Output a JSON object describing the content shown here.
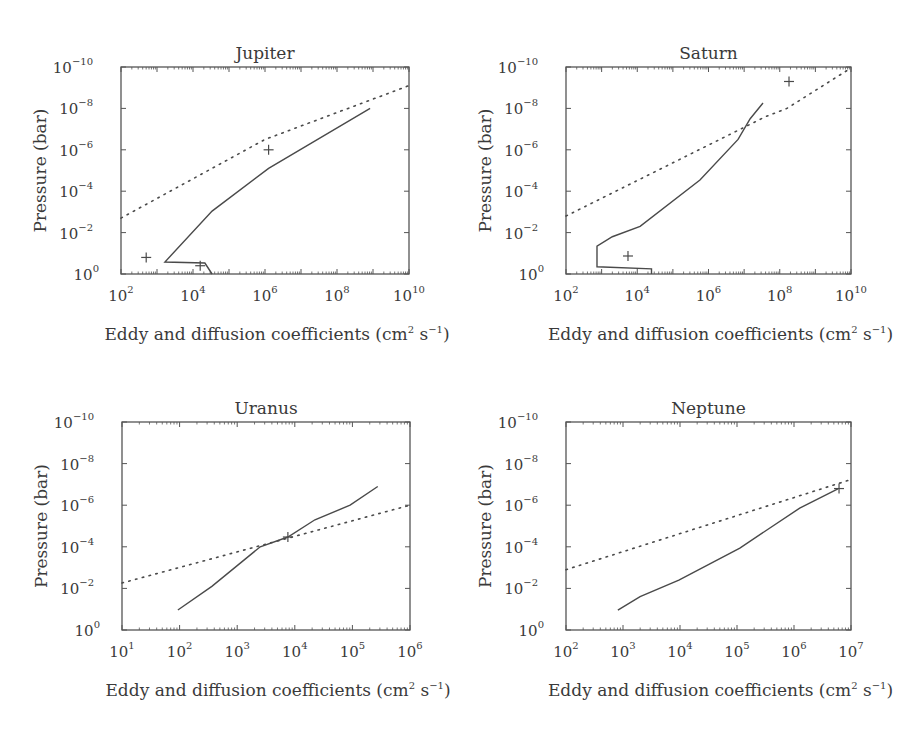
{
  "chart_data": [
    {
      "type": "line",
      "title": "Jupiter",
      "xlabel": "Eddy and diffusion coefficients (cm² s⁻¹)",
      "ylabel": "Pressure (bar)",
      "xscale": "log",
      "yscale": "log",
      "xlim_exp": [
        2,
        10
      ],
      "ylim_exp": [
        0,
        -10
      ],
      "xticks_exp": [
        2,
        4,
        6,
        8,
        10
      ],
      "yticks_exp": [
        -10,
        -8,
        -6,
        -4,
        -2,
        0
      ],
      "box": {
        "x0": 121,
        "x1": 409,
        "y0": 67,
        "y1": 274
      },
      "series": [
        {
          "name": "eddy (solid)",
          "style": "solid",
          "points_log": [
            [
              4.53,
              0.0
            ],
            [
              4.33,
              -0.53
            ],
            [
              3.22,
              -0.58
            ],
            [
              4.53,
              -3.04
            ],
            [
              6.1,
              -5.1
            ],
            [
              8.92,
              -8.0
            ]
          ]
        },
        {
          "name": "diffusion (dotted)",
          "style": "dotted",
          "points_log": [
            [
              2.0,
              -2.7
            ],
            [
              6.0,
              -6.5
            ],
            [
              10.0,
              -9.1
            ]
          ]
        },
        {
          "name": "estimates (+)",
          "style": "marker",
          "points_log": [
            [
              2.7,
              -0.8
            ],
            [
              4.2,
              -0.4
            ],
            [
              6.1,
              -6.0
            ]
          ]
        }
      ]
    },
    {
      "type": "line",
      "title": "Saturn",
      "xlabel": "Eddy and diffusion coefficients (cm² s⁻¹)",
      "ylabel": "Pressure (bar)",
      "xscale": "log",
      "yscale": "log",
      "xlim_exp": [
        2,
        10
      ],
      "ylim_exp": [
        0,
        -10
      ],
      "xticks_exp": [
        2,
        4,
        6,
        8,
        10
      ],
      "yticks_exp": [
        -10,
        -8,
        -6,
        -4,
        -2,
        0
      ],
      "box": {
        "x0": 566,
        "x1": 851,
        "y0": 67,
        "y1": 274
      },
      "series": [
        {
          "name": "eddy (solid)",
          "style": "solid",
          "points_log": [
            [
              4.4,
              0.0
            ],
            [
              4.4,
              -0.25
            ],
            [
              2.87,
              -0.35
            ],
            [
              2.87,
              -1.35
            ],
            [
              3.3,
              -1.8
            ],
            [
              4.08,
              -2.3
            ],
            [
              5.76,
              -4.54
            ],
            [
              6.83,
              -6.5
            ],
            [
              7.17,
              -7.5
            ],
            [
              7.53,
              -8.26
            ]
          ]
        },
        {
          "name": "diffusion (dotted)",
          "style": "dotted",
          "points_log": [
            [
              2.0,
              -2.8
            ],
            [
              7.6,
              -7.6
            ],
            [
              8.2,
              -8.0
            ],
            [
              10.0,
              -9.95
            ]
          ]
        },
        {
          "name": "estimates (+)",
          "style": "marker",
          "points_log": [
            [
              3.74,
              -0.87
            ],
            [
              8.26,
              -9.3
            ]
          ]
        }
      ]
    },
    {
      "type": "line",
      "title": "Uranus",
      "xlabel": "Eddy and diffusion coefficients (cm² s⁻¹)",
      "ylabel": "Pressure (bar)",
      "xscale": "log",
      "yscale": "log",
      "xlim_exp": [
        1,
        6
      ],
      "ylim_exp": [
        0,
        -10
      ],
      "xticks_exp": [
        1,
        2,
        3,
        4,
        5,
        6
      ],
      "yticks_exp": [
        -10,
        -8,
        -6,
        -4,
        -2,
        0
      ],
      "box": {
        "x0": 122,
        "x1": 410,
        "y0": 422,
        "y1": 630
      },
      "series": [
        {
          "name": "eddy (solid)",
          "style": "solid",
          "points_log": [
            [
              1.97,
              -0.96
            ],
            [
              2.56,
              -2.1
            ],
            [
              3.4,
              -4.0
            ],
            [
              3.88,
              -4.47
            ],
            [
              4.35,
              -5.3
            ],
            [
              4.96,
              -6.0
            ],
            [
              5.44,
              -6.9
            ]
          ]
        },
        {
          "name": "diffusion (dotted)",
          "style": "dotted",
          "points_log": [
            [
              1.0,
              -2.26
            ],
            [
              6.0,
              -6.0
            ]
          ]
        },
        {
          "name": "estimates (+)",
          "style": "marker",
          "points_log": [
            [
              3.88,
              -4.47
            ]
          ]
        }
      ]
    },
    {
      "type": "line",
      "title": "Neptune",
      "xlabel": "Eddy and diffusion coefficients (cm² s⁻¹)",
      "ylabel": "Pressure (bar)",
      "xscale": "log",
      "yscale": "log",
      "xlim_exp": [
        2,
        7
      ],
      "ylim_exp": [
        0,
        -10
      ],
      "xticks_exp": [
        2,
        3,
        4,
        5,
        6,
        7
      ],
      "yticks_exp": [
        -10,
        -8,
        -6,
        -4,
        -2,
        0
      ],
      "box": {
        "x0": 566,
        "x1": 851,
        "y0": 422,
        "y1": 630
      },
      "series": [
        {
          "name": "eddy (solid)",
          "style": "solid",
          "points_log": [
            [
              2.91,
              -0.96
            ],
            [
              3.3,
              -1.6
            ],
            [
              3.98,
              -2.4
            ],
            [
              5.05,
              -3.94
            ],
            [
              6.1,
              -5.86
            ],
            [
              6.77,
              -6.78
            ]
          ]
        },
        {
          "name": "diffusion (dotted)",
          "style": "dotted",
          "points_log": [
            [
              2.0,
              -2.9
            ],
            [
              6.96,
              -7.2
            ]
          ]
        },
        {
          "name": "estimates (+)",
          "style": "marker",
          "points_log": [
            [
              6.79,
              -6.8
            ]
          ]
        }
      ]
    }
  ],
  "labels": {
    "ylabel": "Pressure (bar)",
    "xlabel_main": "Eddy and diffusion coefficients (cm",
    "xlabel_sup1": "2",
    "xlabel_mid": " s",
    "xlabel_sup2": "−1",
    "xlabel_end": ")"
  },
  "colors": {
    "line": "#4a4a4a",
    "axis": "#555555",
    "text": "#3a3a3a"
  }
}
